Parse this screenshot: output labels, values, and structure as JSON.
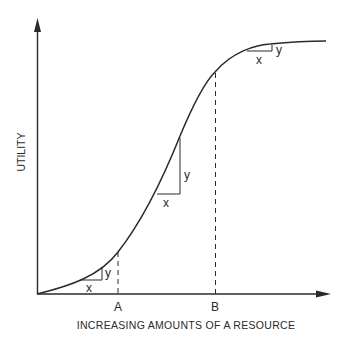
{
  "diagram": {
    "title": "",
    "y_axis_label": "UTILITY",
    "x_axis_label": "INCREASING AMOUNTS OF A RESOURCE",
    "markers": [
      {
        "label": "A",
        "description": "point on the convex (increasing marginal utility) part of the curve"
      },
      {
        "label": "B",
        "description": "point on the concave (diminishing marginal utility) part of the curve"
      }
    ],
    "slope_triangles": [
      {
        "position": "lower",
        "run_label": "x",
        "rise_label": "y"
      },
      {
        "position": "middle",
        "run_label": "x",
        "rise_label": "y"
      },
      {
        "position": "upper",
        "run_label": "x",
        "rise_label": "y"
      }
    ],
    "curve": "S-shaped (sigmoid) utility curve",
    "colors": {
      "line": "#2a2a2a",
      "background": "#ffffff"
    }
  }
}
